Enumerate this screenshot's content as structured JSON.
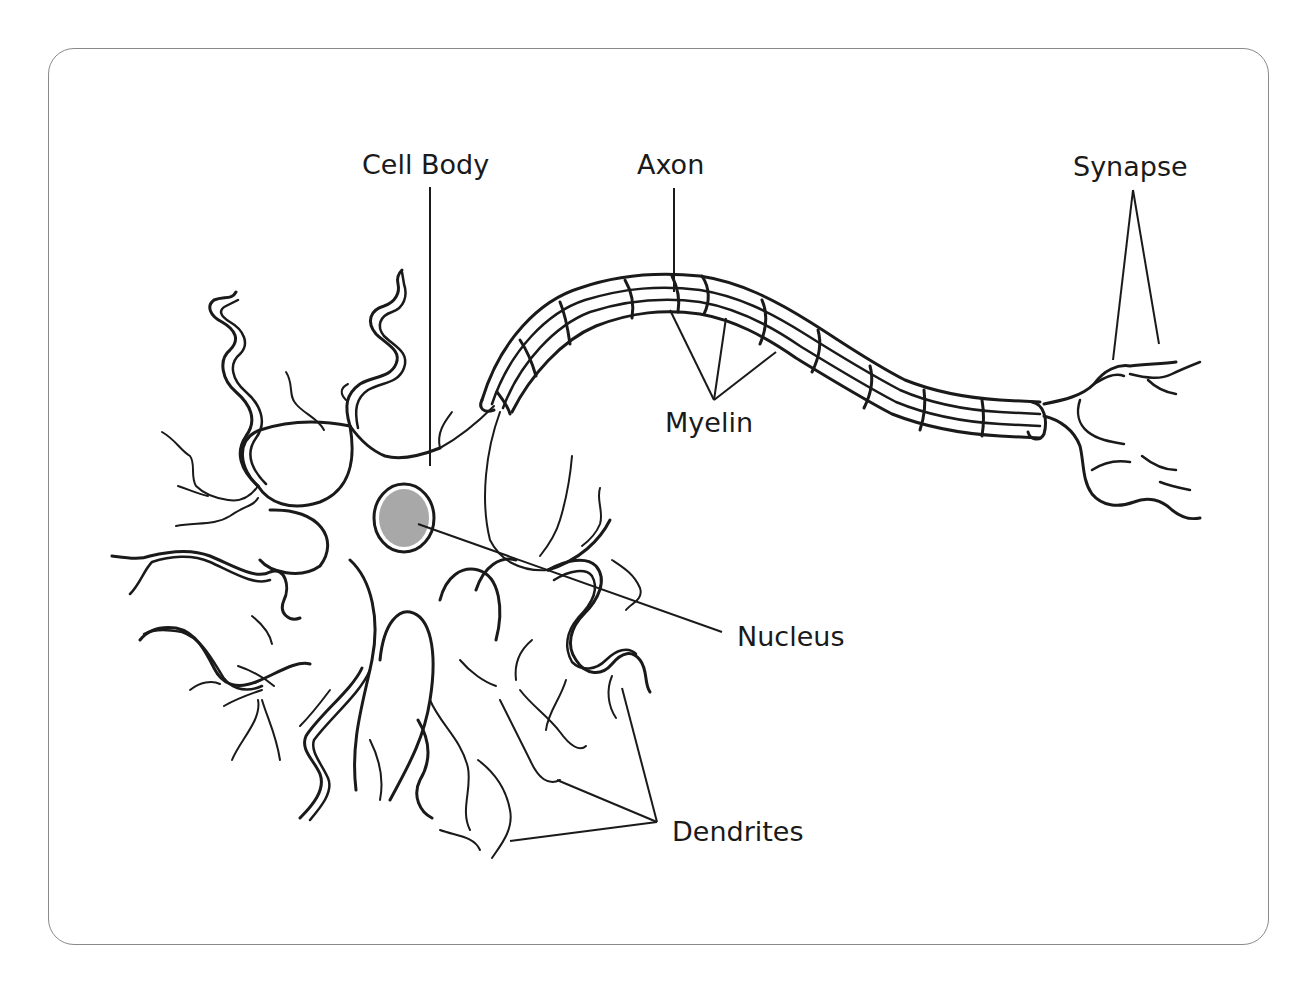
{
  "diagram": {
    "labels": {
      "cell_body": "Cell Body",
      "axon": "Axon",
      "synapse": "Synapse",
      "myelin": "Myelin",
      "nucleus": "Nucleus",
      "dendrites": "Dendrites"
    },
    "colors": {
      "line": "#1a1a1a",
      "nucleus_fill": "#a8a8a8",
      "frame_border": "#8a8a8a",
      "background": "#ffffff"
    }
  }
}
